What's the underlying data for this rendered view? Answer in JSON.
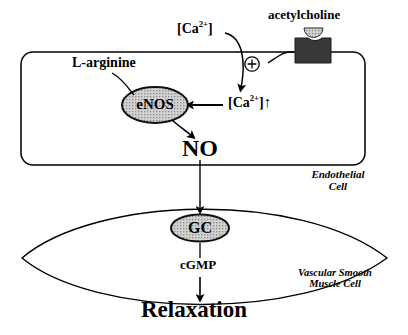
{
  "diagram": {
    "background": "#ffffff",
    "stroke_color": "#000000",
    "ellipse_fill": "#c9c9c9",
    "receptor_fill": "#383838"
  },
  "labels": {
    "acetylcholine": "acetylcholine",
    "calcium_extracellular": "[Ca",
    "calcium_sup": "2+",
    "calcium_close": "]",
    "calcium_intracellular_close": "]",
    "up_arrow": "↑",
    "plus_sign": "+",
    "l_arginine": "L-arginine",
    "enos": "eNOS",
    "no": "NO",
    "gc": "GC",
    "cgmp": "cGMP",
    "relaxation": "Relaxation",
    "endothelial_cell_line1": "Endothelial",
    "endothelial_cell_line2": "Cell",
    "vascular_line1": "Vascular Smooth",
    "vascular_line2": "Muscle Cell"
  },
  "nodes": [
    {
      "id": "acetylcholine",
      "label": "acetylcholine",
      "type": "ligand-label"
    },
    {
      "id": "receptor",
      "label": "membrane-receptor",
      "type": "channel"
    },
    {
      "id": "ca-out",
      "label": "[Ca2+]",
      "type": "species"
    },
    {
      "id": "ca-in",
      "label": "[Ca2+]↑",
      "type": "species"
    },
    {
      "id": "enos",
      "label": "eNOS",
      "type": "enzyme"
    },
    {
      "id": "l-arginine",
      "label": "L-arginine",
      "type": "substrate"
    },
    {
      "id": "no",
      "label": "NO",
      "type": "messenger"
    },
    {
      "id": "gc",
      "label": "GC",
      "type": "enzyme"
    },
    {
      "id": "cgmp",
      "label": "cGMP",
      "type": "messenger"
    },
    {
      "id": "relaxation",
      "label": "Relaxation",
      "type": "outcome"
    }
  ],
  "compartments": [
    {
      "id": "endothelial-cell",
      "label": "Endothelial Cell",
      "shape": "rounded-rectangle"
    },
    {
      "id": "smooth-muscle-cell",
      "label": "Vascular Smooth Muscle Cell",
      "shape": "lens"
    }
  ],
  "edges": [
    {
      "from": "ca-out",
      "to": "ca-in",
      "style": "curved-arrow"
    },
    {
      "from": "receptor",
      "to": "plus",
      "style": "curved-arrow"
    },
    {
      "from": "ca-in",
      "to": "enos",
      "style": "straight-arrow-left"
    },
    {
      "from": "l-arginine",
      "to": "enos",
      "style": "curved-line"
    },
    {
      "from": "enos",
      "to": "no",
      "style": "curved-arrow"
    },
    {
      "from": "no",
      "to": "gc",
      "style": "straight-arrow-down"
    },
    {
      "from": "gc",
      "to": "relaxation",
      "style": "straight-arrow-down",
      "via": "cgmp"
    }
  ]
}
